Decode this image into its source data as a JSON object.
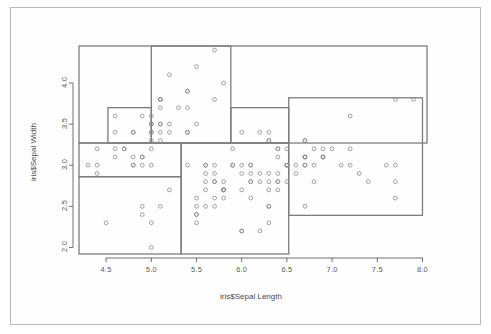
{
  "figure": {
    "title": "",
    "xlabel": "iris$Sepal Length",
    "ylabel": "iris$Sepal Width",
    "frame_color": "#b9b9b9",
    "point_color": "#8a8a8a",
    "rect_color": "#7d7d7d",
    "axis_color": "#707070",
    "background": "#ffffff"
  },
  "chart_data": {
    "type": "scatter",
    "title": "",
    "xlabel": "iris$Sepal Length",
    "ylabel": "iris$Sepal Width",
    "xlim": [
      4.2,
      8.05
    ],
    "ylim": [
      1.92,
      4.45
    ],
    "xticks": [
      4.5,
      5.0,
      5.5,
      6.0,
      6.5,
      7.0,
      7.5,
      8.0
    ],
    "xtick_labels": [
      "4.5",
      "5.0",
      "5.5",
      "6.0",
      "6.5",
      "7.0",
      "7.5",
      "8.0"
    ],
    "yticks": [
      2.0,
      2.5,
      3.0,
      3.5,
      4.0
    ],
    "ytick_labels": [
      "2.0",
      "2.5",
      "3.0",
      "3.5",
      "4.0"
    ],
    "grid": false,
    "legend": false,
    "marker": "open-circle",
    "points": [
      [
        5.1,
        3.5
      ],
      [
        4.9,
        3.0
      ],
      [
        4.7,
        3.2
      ],
      [
        4.6,
        3.1
      ],
      [
        5.0,
        3.6
      ],
      [
        5.4,
        3.9
      ],
      [
        4.6,
        3.4
      ],
      [
        5.0,
        3.4
      ],
      [
        4.4,
        2.9
      ],
      [
        4.9,
        3.1
      ],
      [
        5.4,
        3.7
      ],
      [
        4.8,
        3.4
      ],
      [
        4.8,
        3.0
      ],
      [
        4.3,
        3.0
      ],
      [
        5.8,
        4.0
      ],
      [
        5.7,
        4.4
      ],
      [
        5.4,
        3.9
      ],
      [
        5.1,
        3.5
      ],
      [
        5.7,
        3.8
      ],
      [
        5.1,
        3.8
      ],
      [
        5.4,
        3.4
      ],
      [
        5.1,
        3.7
      ],
      [
        4.6,
        3.6
      ],
      [
        5.1,
        3.3
      ],
      [
        4.8,
        3.4
      ],
      [
        5.0,
        3.0
      ],
      [
        5.0,
        3.4
      ],
      [
        5.2,
        3.5
      ],
      [
        5.2,
        3.4
      ],
      [
        4.7,
        3.2
      ],
      [
        4.8,
        3.1
      ],
      [
        5.4,
        3.4
      ],
      [
        5.2,
        4.1
      ],
      [
        5.5,
        4.2
      ],
      [
        4.9,
        3.1
      ],
      [
        5.0,
        3.2
      ],
      [
        5.5,
        3.5
      ],
      [
        4.9,
        3.6
      ],
      [
        4.4,
        3.0
      ],
      [
        5.1,
        3.4
      ],
      [
        5.0,
        3.5
      ],
      [
        4.5,
        2.3
      ],
      [
        4.4,
        3.2
      ],
      [
        5.0,
        3.5
      ],
      [
        5.1,
        3.8
      ],
      [
        4.8,
        3.0
      ],
      [
        5.1,
        3.8
      ],
      [
        4.6,
        3.2
      ],
      [
        5.3,
        3.7
      ],
      [
        5.0,
        3.3
      ],
      [
        7.0,
        3.2
      ],
      [
        6.4,
        3.2
      ],
      [
        6.9,
        3.1
      ],
      [
        5.5,
        2.3
      ],
      [
        6.5,
        2.8
      ],
      [
        5.7,
        2.8
      ],
      [
        6.3,
        3.3
      ],
      [
        4.9,
        2.4
      ],
      [
        6.6,
        2.9
      ],
      [
        5.2,
        2.7
      ],
      [
        5.0,
        2.0
      ],
      [
        5.9,
        3.0
      ],
      [
        6.0,
        2.2
      ],
      [
        6.1,
        2.9
      ],
      [
        5.6,
        2.9
      ],
      [
        6.7,
        3.1
      ],
      [
        5.6,
        3.0
      ],
      [
        5.8,
        2.7
      ],
      [
        6.2,
        2.2
      ],
      [
        5.6,
        2.5
      ],
      [
        5.9,
        3.2
      ],
      [
        6.1,
        2.8
      ],
      [
        6.3,
        2.5
      ],
      [
        6.1,
        2.8
      ],
      [
        6.4,
        2.9
      ],
      [
        6.6,
        3.0
      ],
      [
        6.8,
        2.8
      ],
      [
        6.7,
        3.0
      ],
      [
        6.0,
        2.9
      ],
      [
        5.7,
        2.6
      ],
      [
        5.5,
        2.4
      ],
      [
        5.5,
        2.4
      ],
      [
        5.8,
        2.7
      ],
      [
        6.0,
        2.7
      ],
      [
        5.4,
        3.0
      ],
      [
        6.0,
        3.4
      ],
      [
        6.7,
        3.1
      ],
      [
        6.3,
        2.3
      ],
      [
        5.6,
        3.0
      ],
      [
        5.5,
        2.5
      ],
      [
        5.5,
        2.6
      ],
      [
        6.1,
        3.0
      ],
      [
        5.8,
        2.6
      ],
      [
        5.0,
        2.3
      ],
      [
        5.6,
        2.7
      ],
      [
        5.7,
        3.0
      ],
      [
        5.7,
        2.9
      ],
      [
        6.2,
        2.9
      ],
      [
        5.1,
        2.5
      ],
      [
        5.7,
        2.8
      ],
      [
        6.3,
        3.3
      ],
      [
        5.8,
        2.7
      ],
      [
        7.1,
        3.0
      ],
      [
        6.3,
        2.9
      ],
      [
        6.5,
        3.0
      ],
      [
        7.6,
        3.0
      ],
      [
        4.9,
        2.5
      ],
      [
        7.3,
        2.9
      ],
      [
        6.7,
        2.5
      ],
      [
        7.2,
        3.6
      ],
      [
        6.5,
        3.2
      ],
      [
        6.4,
        2.7
      ],
      [
        6.8,
        3.0
      ],
      [
        5.7,
        2.5
      ],
      [
        5.8,
        2.8
      ],
      [
        6.4,
        3.2
      ],
      [
        6.5,
        3.0
      ],
      [
        7.7,
        3.8
      ],
      [
        7.7,
        2.6
      ],
      [
        6.0,
        2.2
      ],
      [
        6.9,
        3.2
      ],
      [
        5.6,
        2.8
      ],
      [
        7.7,
        2.8
      ],
      [
        6.3,
        2.7
      ],
      [
        6.7,
        3.3
      ],
      [
        7.2,
        3.2
      ],
      [
        6.2,
        2.8
      ],
      [
        6.1,
        3.0
      ],
      [
        6.4,
        2.8
      ],
      [
        7.2,
        3.0
      ],
      [
        7.4,
        2.8
      ],
      [
        7.9,
        3.8
      ],
      [
        6.4,
        2.8
      ],
      [
        6.3,
        2.8
      ],
      [
        6.1,
        2.6
      ],
      [
        7.7,
        3.0
      ],
      [
        6.3,
        3.4
      ],
      [
        6.4,
        3.1
      ],
      [
        6.0,
        3.0
      ],
      [
        6.9,
        3.1
      ],
      [
        6.7,
        3.1
      ],
      [
        6.9,
        3.1
      ],
      [
        5.8,
        2.7
      ],
      [
        6.8,
        3.2
      ],
      [
        6.7,
        3.3
      ],
      [
        6.7,
        3.0
      ],
      [
        6.3,
        2.5
      ],
      [
        6.5,
        3.0
      ],
      [
        6.2,
        3.4
      ],
      [
        5.9,
        3.0
      ]
    ],
    "regions": [
      {
        "name": "region-outer-top",
        "x0": 4.2,
        "x1": 8.05,
        "y0": 3.27,
        "y1": 4.45
      },
      {
        "name": "region-upper-left-small",
        "x0": 4.52,
        "x1": 5.0,
        "y0": 3.27,
        "y1": 3.7
      },
      {
        "name": "region-top-center-tall",
        "x0": 5.0,
        "x1": 5.88,
        "y0": 3.27,
        "y1": 4.45
      },
      {
        "name": "region-mid-left",
        "x0": 4.2,
        "x1": 5.33,
        "y0": 2.86,
        "y1": 3.27
      },
      {
        "name": "region-lower-left",
        "x0": 4.2,
        "x1": 5.33,
        "y0": 1.92,
        "y1": 2.86
      },
      {
        "name": "region-center-lower",
        "x0": 5.33,
        "x1": 6.52,
        "y0": 1.92,
        "y1": 3.27
      },
      {
        "name": "region-right-large",
        "x0": 6.52,
        "x1": 8.0,
        "y0": 2.39,
        "y1": 3.82
      },
      {
        "name": "region-right-strip-top",
        "x0": 5.88,
        "x1": 6.52,
        "y0": 3.27,
        "y1": 3.7
      }
    ]
  }
}
